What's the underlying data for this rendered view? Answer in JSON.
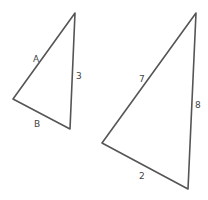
{
  "diagram": {
    "triangles": [
      {
        "name": "small-triangle",
        "vertices": [
          [
            75,
            13
          ],
          [
            13,
            99
          ],
          [
            70,
            129
          ]
        ],
        "labels": {
          "left_side": "A",
          "right_side": "3",
          "bottom_side": "B"
        }
      },
      {
        "name": "large-triangle",
        "vertices": [
          [
            196,
            13
          ],
          [
            102,
            143
          ],
          [
            188,
            189
          ]
        ],
        "labels": {
          "left_side": "7",
          "right_side": "8",
          "bottom_side": "2"
        }
      }
    ],
    "stroke_color": "#555555"
  }
}
